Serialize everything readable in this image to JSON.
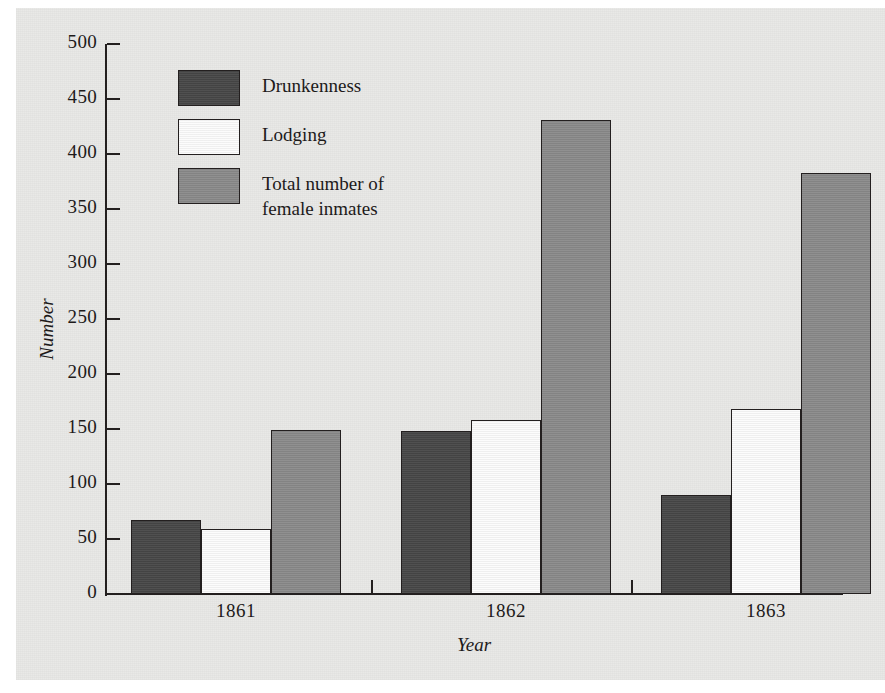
{
  "chart_data": {
    "type": "bar",
    "title": "",
    "xlabel": "Year",
    "ylabel": "Number",
    "categories": [
      "1861",
      "1862",
      "1863"
    ],
    "ylim": [
      0,
      500
    ],
    "ytick_step": 50,
    "yticks": [
      0,
      50,
      100,
      150,
      200,
      250,
      300,
      350,
      400,
      450,
      500
    ],
    "ytick_labels": [
      "0",
      "50",
      "100",
      "150",
      "200",
      "250",
      "300",
      "350",
      "400",
      "450",
      "500"
    ],
    "grid": false,
    "legend_position": "upper-left-inside",
    "series": [
      {
        "name": "Drunkenness",
        "color": "#474747",
        "values": [
          67,
          148,
          90
        ]
      },
      {
        "name": "Lodging",
        "color": "#fcfcfc",
        "values": [
          59,
          158,
          168
        ]
      },
      {
        "name": "Total number of\nfemale inmates",
        "color": "#8a8a8a",
        "values": [
          149,
          431,
          383
        ]
      }
    ]
  },
  "legend": {
    "items": [
      {
        "label": "Drunkenness",
        "color": "#474747"
      },
      {
        "label": "Lodging",
        "color": "#fcfcfc"
      },
      {
        "label": "Total number of\nfemale inmates",
        "color": "#8a8a8a"
      }
    ]
  },
  "axes": {
    "y_title": "Number",
    "x_title": "Year",
    "y_labels": [
      "500",
      "450",
      "400",
      "350",
      "300",
      "250",
      "200",
      "150",
      "100",
      "50",
      "0"
    ],
    "x_labels": [
      "1861",
      "1862",
      "1863"
    ]
  },
  "colors": {
    "paper": "#e9e9e7",
    "ink": "#231f1f",
    "drunkenness": "#474747",
    "lodging": "#fcfcfc",
    "total_female_inmates": "#8a8a8a"
  }
}
